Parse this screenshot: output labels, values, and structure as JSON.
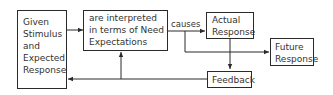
{
  "diagram": {
    "nodes": {
      "stimulus": {
        "lines": [
          "Given",
          "Stimulus",
          "and",
          "Expected",
          "Response"
        ]
      },
      "interpreted": {
        "lines": [
          "are interpreted",
          "in terms of Need",
          "Expectations"
        ]
      },
      "actual": {
        "lines": [
          "Actual",
          "Response"
        ]
      },
      "future": {
        "lines": [
          "Future",
          "Response"
        ]
      },
      "feedback": {
        "lines": [
          "Feedback"
        ]
      }
    },
    "edges": [
      {
        "from": "stimulus",
        "to": "interpreted",
        "label": ""
      },
      {
        "from": "interpreted",
        "to": "actual",
        "label": "causes"
      },
      {
        "from": "interpreted",
        "to": "future",
        "label": ""
      },
      {
        "from": "actual",
        "to": "feedback",
        "label": ""
      },
      {
        "from": "feedback",
        "to": "stimulus",
        "label": ""
      },
      {
        "from": "feedback",
        "to": "interpreted",
        "label": ""
      }
    ],
    "edge_label_causes": "causes"
  }
}
